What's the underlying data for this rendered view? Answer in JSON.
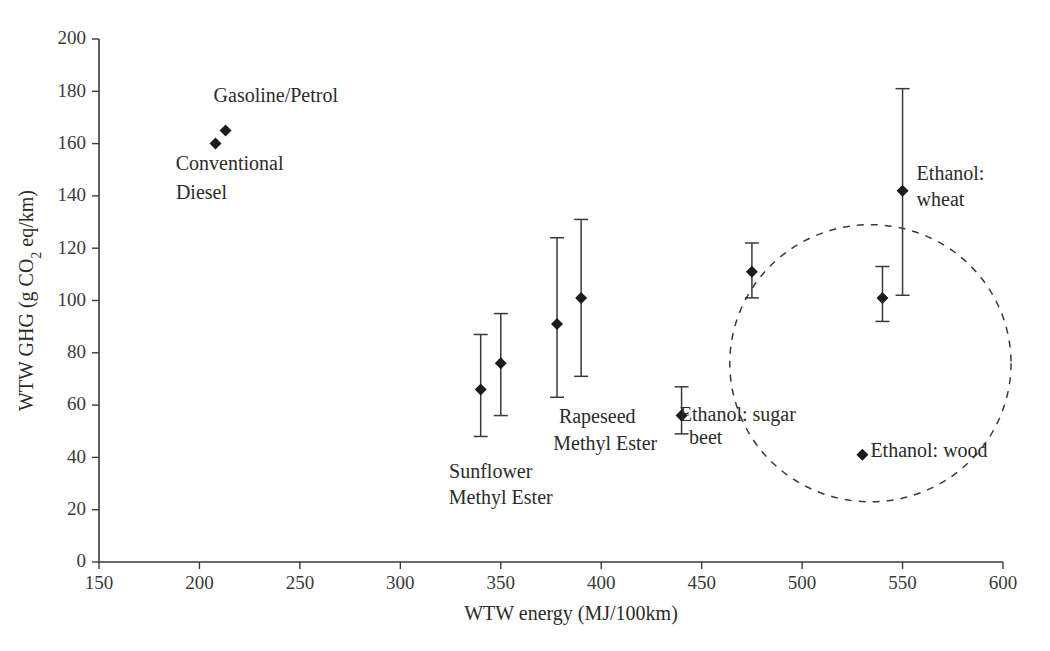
{
  "chart_data": {
    "type": "scatter",
    "title": "",
    "xlabel": "WTW energy (MJ/100km)",
    "ylabel": "WTW GHG (g CO2 eq/km)",
    "ylabel_parts": {
      "pre": "WTW GHG (g CO",
      "sub": "2",
      "post": " eq/km)"
    },
    "xlim": [
      150,
      600
    ],
    "ylim": [
      0,
      200
    ],
    "xticks": [
      150,
      200,
      250,
      300,
      350,
      400,
      450,
      500,
      550,
      600
    ],
    "yticks": [
      0,
      20,
      40,
      60,
      80,
      100,
      120,
      140,
      160,
      180,
      200
    ],
    "grid": false,
    "legend": "none",
    "points": [
      {
        "name": "Conventional Diesel",
        "x": 208,
        "y": 160,
        "ylow": null,
        "yhigh": null
      },
      {
        "name": "Gasoline/Petrol",
        "x": 213,
        "y": 165,
        "ylow": null,
        "yhigh": null
      },
      {
        "name": "Sunflower Methyl Ester (a)",
        "x": 340,
        "y": 66,
        "ylow": 48,
        "yhigh": 87
      },
      {
        "name": "Sunflower Methyl Ester (b)",
        "x": 350,
        "y": 76,
        "ylow": 56,
        "yhigh": 95
      },
      {
        "name": "Rapeseed Methyl Ester (a)",
        "x": 378,
        "y": 91,
        "ylow": 63,
        "yhigh": 124
      },
      {
        "name": "Rapeseed Methyl Ester (b)",
        "x": 390,
        "y": 101,
        "ylow": 71,
        "yhigh": 131
      },
      {
        "name": "Ethanol: sugar beet (a)",
        "x": 440,
        "y": 56,
        "ylow": 49,
        "yhigh": 67
      },
      {
        "name": "Ethanol: sugar beet (b)",
        "x": 475,
        "y": 111,
        "ylow": 101,
        "yhigh": 122
      },
      {
        "name": "Ethanol: sugar beet (c)",
        "x": 540,
        "y": 101,
        "ylow": 92,
        "yhigh": 113
      },
      {
        "name": "Ethanol: wheat",
        "x": 550,
        "y": 142,
        "ylow": 102,
        "yhigh": 181
      },
      {
        "name": "Ethanol: wood",
        "x": 530,
        "y": 41,
        "ylow": null,
        "yhigh": null
      }
    ],
    "annotations": [
      {
        "id": "gasoline",
        "text": "Gasoline/Petrol",
        "x": 238,
        "y": 176,
        "align": "mid"
      },
      {
        "id": "diesel-1",
        "text": "Conventional",
        "x": 215,
        "y": 150,
        "align": "mid"
      },
      {
        "id": "diesel-2",
        "text": "Diesel",
        "x": 201,
        "y": 139,
        "align": "mid"
      },
      {
        "id": "sunflower-1",
        "text": "Sunflower",
        "x": 345,
        "y": 32,
        "align": "mid"
      },
      {
        "id": "sunflower-2",
        "text": "Methyl Ester",
        "x": 350,
        "y": 22,
        "align": "mid"
      },
      {
        "id": "rapeseed-1",
        "text": "Rapeseed",
        "x": 398,
        "y": 53,
        "align": "mid"
      },
      {
        "id": "rapeseed-2",
        "text": "Methyl Ester",
        "x": 402,
        "y": 43,
        "align": "mid"
      },
      {
        "id": "sugarbeet-1",
        "text": "Ethanol: sugar",
        "x": 468,
        "y": 54,
        "align": "mid"
      },
      {
        "id": "sugarbeet-2",
        "text": "beet",
        "x": 452,
        "y": 45,
        "align": "mid"
      },
      {
        "id": "wheat-1",
        "text": "Ethanol:",
        "x": 557,
        "y": 146,
        "align": "start"
      },
      {
        "id": "wheat-2",
        "text": "wheat",
        "x": 557,
        "y": 136,
        "align": "start"
      },
      {
        "id": "wood",
        "text": "Ethanol: wood",
        "x": 534,
        "y": 40,
        "align": "start"
      }
    ],
    "highlight_region": {
      "shape": "dashed-ellipse",
      "cx": 534,
      "cy": 76,
      "rx": 70,
      "ry": 53
    }
  }
}
